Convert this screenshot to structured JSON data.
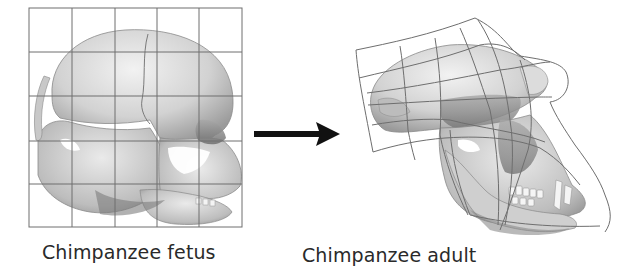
{
  "figure": {
    "panels": [
      {
        "id": "fetus",
        "caption": "Chimpanzee fetus",
        "grid": {
          "type": "regular",
          "columns": 5,
          "rows": 5
        }
      },
      {
        "id": "adult",
        "caption": "Chimpanzee adult",
        "grid": {
          "type": "transformed",
          "columns": 5,
          "rows": 5
        }
      }
    ],
    "arrow": {
      "direction": "right",
      "meaning": "transformation"
    },
    "colors": {
      "grid_line": "#6e6e6e",
      "skull_light": "#e4e4e4",
      "skull_mid": "#b8b8b8",
      "skull_dark": "#7a7a7a",
      "arrow": "#111111",
      "caption_text": "#2a2a2a"
    }
  }
}
